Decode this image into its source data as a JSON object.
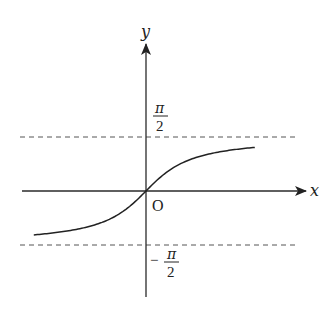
{
  "diagram": {
    "function": "arctan",
    "x_axis_label": "x",
    "y_axis_label": "y",
    "origin_label": "O",
    "upper_asymptote": {
      "value": 1.5707963,
      "numerator": "π",
      "denominator": "2",
      "sign": ""
    },
    "lower_asymptote": {
      "value": -1.5707963,
      "numerator": "π",
      "denominator": "2",
      "sign": "−"
    },
    "x_domain_shown": [
      -3.3,
      3.2
    ]
  }
}
